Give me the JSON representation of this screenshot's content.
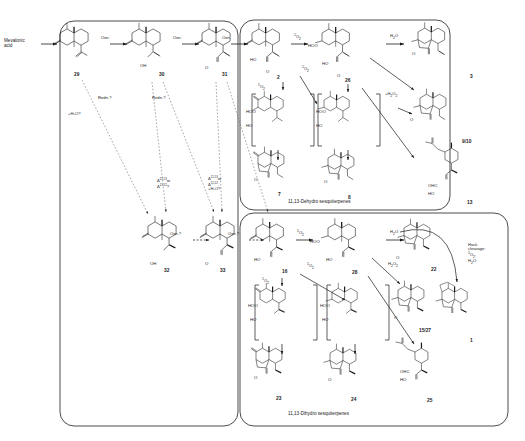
{
  "figure": {
    "type": "reaction-scheme",
    "background": "#ffffff",
    "ink": "#1a1a1a"
  },
  "feedstock": {
    "line1": "Mevalonic",
    "line2": "acid"
  },
  "panels": [
    {
      "id": "panel-precursors",
      "caption": ""
    },
    {
      "id": "panel-dehydro",
      "caption": "11,13-Dehydro sesquiterpenes"
    },
    {
      "id": "panel-dihydro",
      "caption": "11,13-Dihydro sesquiterpenes"
    }
  ],
  "reagents": {
    "oxn1": "Oxn.",
    "oxn2": "Oxn.",
    "oxn3": "Oxn.",
    "oxn4": "Oxn.?",
    "oxn5": "Oxn.?",
    "redn1": "Redn.?",
    "redn2": "Redn.?",
    "water_q1": "+H",
    "water_q1b": "2",
    "water_q1c": "O?",
    "singlet_o2": "1O2",
    "water": "H2O",
    "hydrogen_peroxide": "H2O2",
    "hock_l1": "Hock",
    "hock_l2": "cleavage:",
    "hock_l3": "1O2,",
    "hock_l4": "H2O"
  },
  "annotations": {
    "plus_water_q": "+H₂O?",
    "delta_a1": "Δ",
    "delta_a1_sup": "11,13",
    "delta_a1_tail": "or",
    "delta_a2": "Δ",
    "delta_a2_sup": "11,12",
    "delta_a2_tail": "?",
    "delta_b1": "Δ",
    "delta_b1_sup": "11,13",
    "delta_b1_tail": "or",
    "delta_b2": "Δ",
    "delta_b2_sup": "11,12",
    "delta_b2_tail": ",",
    "delta_b3": "+H₂O?"
  },
  "compounds": [
    {
      "id": "29",
      "label": "29",
      "panel": "panel-precursors",
      "x": 74,
      "y": 72
    },
    {
      "id": "30",
      "label": "30",
      "panel": "panel-precursors",
      "x": 159,
      "y": 72
    },
    {
      "id": "31",
      "label": "31",
      "panel": "panel-precursors",
      "x": 222,
      "y": 72
    },
    {
      "id": "32",
      "label": "32",
      "panel": "panel-precursors",
      "x": 164,
      "y": 268
    },
    {
      "id": "33",
      "label": "33",
      "panel": "panel-precursors",
      "x": 220,
      "y": 268
    },
    {
      "id": "2",
      "label": "2",
      "panel": "panel-dehydro",
      "x": 277,
      "y": 75
    },
    {
      "id": "26",
      "label": "26",
      "panel": "panel-dehydro",
      "x": 345,
      "y": 78
    },
    {
      "id": "3",
      "label": "3",
      "panel": "panel-dehydro",
      "x": 470,
      "y": 74
    },
    {
      "id": "9/10",
      "label": "9/10",
      "panel": "panel-dehydro",
      "x": 466,
      "y": 139
    },
    {
      "id": "7",
      "label": "7",
      "panel": "panel-dehydro",
      "x": 278,
      "y": 192
    },
    {
      "id": "8",
      "label": "8",
      "panel": "panel-dehydro",
      "x": 348,
      "y": 195
    },
    {
      "id": "13",
      "label": "13",
      "panel": "panel-dehydro",
      "x": 467,
      "y": 200
    },
    {
      "id": "16",
      "label": "16",
      "panel": "panel-dihydro",
      "x": 282,
      "y": 269
    },
    {
      "id": "28",
      "label": "28",
      "panel": "panel-dihydro",
      "x": 352,
      "y": 270
    },
    {
      "id": "22",
      "label": "22",
      "panel": "panel-dihydro",
      "x": 431,
      "y": 267
    },
    {
      "id": "15/27",
      "label": "15/27",
      "panel": "panel-dihydro",
      "x": 423,
      "y": 328
    },
    {
      "id": "1",
      "label": "1",
      "panel": "panel-dihydro",
      "x": 470,
      "y": 338
    },
    {
      "id": "23",
      "label": "23",
      "panel": "panel-dihydro",
      "x": 276,
      "y": 396
    },
    {
      "id": "24",
      "label": "24",
      "panel": "panel-dihydro",
      "x": 351,
      "y": 397
    },
    {
      "id": "25",
      "label": "25",
      "panel": "panel-dihydro",
      "x": 427,
      "y": 398
    }
  ],
  "atom_labels": {
    "H": "H",
    "OH": "OH",
    "HO": "HO",
    "O": "O",
    "HOO": "HOO",
    "OHC": "OHC",
    "HOOa": "HOO"
  }
}
